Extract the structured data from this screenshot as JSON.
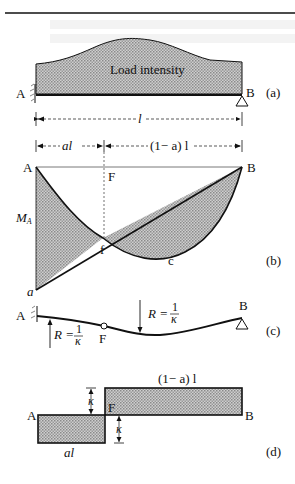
{
  "figure": {
    "panels": [
      {
        "id": "a",
        "tag": "(a)",
        "title": "Load intensity",
        "support_left": "A",
        "support_right": "B",
        "span_label": "l"
      },
      {
        "id": "b",
        "tag": "(b)",
        "corner_left": "A",
        "corner_right": "B",
        "point_F": "F",
        "point_f": "f",
        "curve_label": "c",
        "bottom_label": "a",
        "moment_label": "M",
        "moment_sub": "A",
        "dim_left": "al",
        "dim_right": "(1− a) l"
      },
      {
        "id": "c",
        "tag": "(c)",
        "support_left": "A",
        "support_right": "B",
        "hinge": "F",
        "radius_left": "R =",
        "radius_right": "R =",
        "frac_num": "1",
        "frac_den": "κ"
      },
      {
        "id": "d",
        "tag": "(d)",
        "left": "A",
        "right": "B",
        "mid": "F",
        "top_label": "(1− a) l",
        "bottom_label": "al",
        "kappa_top": "κ",
        "kappa_bottom": "κ"
      }
    ]
  },
  "colors": {
    "ink": "#111111",
    "fill": "#b9b9b9",
    "ghost": "#f2f2f2"
  }
}
